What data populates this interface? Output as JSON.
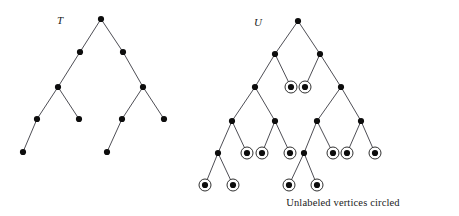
{
  "figure": {
    "caption": "Unlabeled vertices circled",
    "caption_pos": {
      "x": 343,
      "y": 197
    },
    "background": "#ffffff",
    "edge_color": "#3a3a42",
    "node_color": "#0d0d0d",
    "ring_color": "#1a1a1a",
    "node_radius": 3.1,
    "ring_radius": 6.0,
    "edge_width": 0.9,
    "ring_width": 0.9
  },
  "trees": [
    {
      "id": "tree-T",
      "label": "T",
      "label_pos": {
        "x": 57,
        "y": 14
      },
      "nodes": [
        {
          "id": "t0",
          "x": 101,
          "y": 19,
          "circled": false
        },
        {
          "id": "t1",
          "x": 80,
          "y": 52,
          "circled": false
        },
        {
          "id": "t2",
          "x": 123,
          "y": 52,
          "circled": false
        },
        {
          "id": "t3",
          "x": 58,
          "y": 87,
          "circled": false
        },
        {
          "id": "t4",
          "x": 143,
          "y": 87,
          "circled": false
        },
        {
          "id": "t5",
          "x": 37,
          "y": 119,
          "circled": false
        },
        {
          "id": "t6",
          "x": 79,
          "y": 119,
          "circled": false
        },
        {
          "id": "t7",
          "x": 122,
          "y": 119,
          "circled": false
        },
        {
          "id": "t8",
          "x": 164,
          "y": 119,
          "circled": false
        },
        {
          "id": "t9",
          "x": 23,
          "y": 152,
          "circled": false
        },
        {
          "id": "t10",
          "x": 107,
          "y": 152,
          "circled": false
        }
      ],
      "edges": [
        [
          "t0",
          "t1"
        ],
        [
          "t0",
          "t2"
        ],
        [
          "t1",
          "t3"
        ],
        [
          "t2",
          "t4"
        ],
        [
          "t3",
          "t5"
        ],
        [
          "t3",
          "t6"
        ],
        [
          "t4",
          "t7"
        ],
        [
          "t4",
          "t8"
        ],
        [
          "t5",
          "t9"
        ],
        [
          "t7",
          "t10"
        ]
      ]
    },
    {
      "id": "tree-U",
      "label": "U",
      "label_pos": {
        "x": 254,
        "y": 16
      },
      "nodes": [
        {
          "id": "u0",
          "x": 298,
          "y": 21,
          "circled": false
        },
        {
          "id": "u1",
          "x": 275,
          "y": 54,
          "circled": false
        },
        {
          "id": "u2",
          "x": 320,
          "y": 54,
          "circled": false
        },
        {
          "id": "u3",
          "x": 255,
          "y": 87,
          "circled": false
        },
        {
          "id": "u4",
          "x": 291,
          "y": 87,
          "circled": true
        },
        {
          "id": "u5",
          "x": 305,
          "y": 87,
          "circled": true
        },
        {
          "id": "u6",
          "x": 341,
          "y": 87,
          "circled": false
        },
        {
          "id": "u7",
          "x": 232,
          "y": 121,
          "circled": false
        },
        {
          "id": "u8",
          "x": 275,
          "y": 121,
          "circled": false
        },
        {
          "id": "u9",
          "x": 317,
          "y": 121,
          "circled": false
        },
        {
          "id": "u10",
          "x": 361,
          "y": 121,
          "circled": false
        },
        {
          "id": "u11",
          "x": 218,
          "y": 153,
          "circled": false
        },
        {
          "id": "u12",
          "x": 247,
          "y": 153,
          "circled": true
        },
        {
          "id": "u13",
          "x": 262,
          "y": 153,
          "circled": true
        },
        {
          "id": "u14",
          "x": 290,
          "y": 153,
          "circled": true
        },
        {
          "id": "u15",
          "x": 304,
          "y": 153,
          "circled": false
        },
        {
          "id": "u16",
          "x": 333,
          "y": 153,
          "circled": true
        },
        {
          "id": "u17",
          "x": 347,
          "y": 153,
          "circled": true
        },
        {
          "id": "u18",
          "x": 375,
          "y": 153,
          "circled": true
        },
        {
          "id": "u19",
          "x": 205,
          "y": 185,
          "circled": true
        },
        {
          "id": "u20",
          "x": 233,
          "y": 185,
          "circled": true
        },
        {
          "id": "u21",
          "x": 289,
          "y": 185,
          "circled": true
        },
        {
          "id": "u22",
          "x": 317,
          "y": 185,
          "circled": true
        }
      ],
      "edges": [
        [
          "u0",
          "u1"
        ],
        [
          "u0",
          "u2"
        ],
        [
          "u1",
          "u3"
        ],
        [
          "u1",
          "u4"
        ],
        [
          "u2",
          "u5"
        ],
        [
          "u2",
          "u6"
        ],
        [
          "u3",
          "u7"
        ],
        [
          "u3",
          "u8"
        ],
        [
          "u6",
          "u9"
        ],
        [
          "u6",
          "u10"
        ],
        [
          "u7",
          "u11"
        ],
        [
          "u7",
          "u12"
        ],
        [
          "u8",
          "u13"
        ],
        [
          "u8",
          "u14"
        ],
        [
          "u9",
          "u15"
        ],
        [
          "u9",
          "u16"
        ],
        [
          "u10",
          "u17"
        ],
        [
          "u10",
          "u18"
        ],
        [
          "u11",
          "u19"
        ],
        [
          "u11",
          "u20"
        ],
        [
          "u15",
          "u21"
        ],
        [
          "u15",
          "u22"
        ]
      ]
    }
  ]
}
